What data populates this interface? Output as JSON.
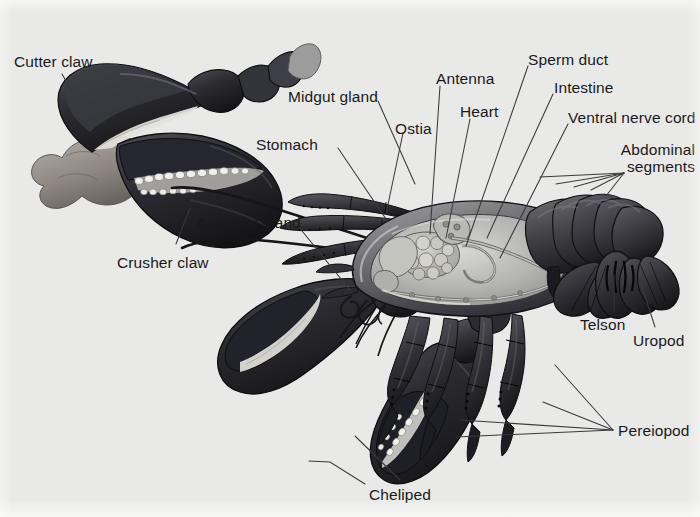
{
  "figure": {
    "background_color": "#e9e9e7",
    "label_color": "#19191b",
    "leader_color": "#3a3a3c",
    "width": 700,
    "height": 517
  },
  "labels": [
    {
      "id": "cutter-claw",
      "text": "Cutter claw",
      "x": 14,
      "y": 54,
      "align": "left"
    },
    {
      "id": "midgut-gland",
      "text": "Midgut gland",
      "x": 288,
      "y": 89,
      "align": "left"
    },
    {
      "id": "stomach",
      "text": "Stomach",
      "x": 256,
      "y": 137,
      "align": "left"
    },
    {
      "id": "ostia",
      "text": "Ostia",
      "x": 395,
      "y": 121,
      "align": "left"
    },
    {
      "id": "antenna",
      "text": "Antenna",
      "x": 436,
      "y": 71,
      "align": "left"
    },
    {
      "id": "heart",
      "text": "Heart",
      "x": 460,
      "y": 104,
      "align": "left"
    },
    {
      "id": "sperm-duct",
      "text": "Sperm duct",
      "x": 528,
      "y": 52,
      "align": "left"
    },
    {
      "id": "intestine",
      "text": "Intestine",
      "x": 554,
      "y": 80,
      "align": "left"
    },
    {
      "id": "ventral-nerve-cord",
      "text": "Ventral nerve cord",
      "x": 568,
      "y": 110,
      "align": "left"
    },
    {
      "id": "abdominal-segments",
      "text": "Abdominal\nsegments",
      "x": 695,
      "y": 142,
      "align": "right"
    },
    {
      "id": "antennal-gland",
      "text": "Antennal gland",
      "x": 196,
      "y": 215,
      "align": "left"
    },
    {
      "id": "crusher-claw",
      "text": "Crusher claw",
      "x": 117,
      "y": 255,
      "align": "left"
    },
    {
      "id": "telson",
      "text": "Telson",
      "x": 580,
      "y": 317,
      "align": "left"
    },
    {
      "id": "uropod",
      "text": "Uropod",
      "x": 633,
      "y": 333,
      "align": "left"
    },
    {
      "id": "pereiopod",
      "text": "Pereiopod",
      "x": 618,
      "y": 423,
      "align": "left"
    },
    {
      "id": "cheliped",
      "text": "Cheliped",
      "x": 369,
      "y": 487,
      "align": "left"
    }
  ],
  "leaders": [
    {
      "id": "leader-cutter-claw",
      "points": "62,74 86,116"
    },
    {
      "id": "leader-midgut-gland",
      "points": "378,101 415,184"
    },
    {
      "id": "leader-stomach",
      "points": "338,148 388,222"
    },
    {
      "id": "leader-ostia",
      "points": "403,133 386,214"
    },
    {
      "id": "leader-antenna",
      "points": "440,86 430,234"
    },
    {
      "id": "leader-heart",
      "points": "470,119 446,238"
    },
    {
      "id": "leader-sperm-duct",
      "points": "528,66 466,246"
    },
    {
      "id": "leader-intestine",
      "points": "553,94 487,238"
    },
    {
      "id": "leader-ventral-nerve-cord",
      "points": "568,124 500,258"
    },
    {
      "id": "leader-abdseg-1",
      "points": "624,173 540,177"
    },
    {
      "id": "leader-abdseg-2",
      "points": "624,173 556,184"
    },
    {
      "id": "leader-abdseg-3",
      "points": "624,173 574,187"
    },
    {
      "id": "leader-abdseg-4",
      "points": "624,173 591,190"
    },
    {
      "id": "leader-abdseg-5",
      "points": "624,173 606,196"
    },
    {
      "id": "leader-antennal-gland",
      "points": "298,226 350,290"
    },
    {
      "id": "leader-crusher-claw",
      "points": "176,244 190,208"
    },
    {
      "id": "leader-telson",
      "points": "614,312 614,275"
    },
    {
      "id": "leader-uropod",
      "points": "655,327 640,280"
    },
    {
      "id": "leader-pereiopod-1",
      "points": "613,430 555,365"
    },
    {
      "id": "leader-pereiopod-2",
      "points": "613,430 543,402"
    },
    {
      "id": "leader-pereiopod-3",
      "points": "613,430 460,420"
    },
    {
      "id": "leader-pereiopod-4",
      "points": "613,430 456,437"
    },
    {
      "id": "leader-cheliped-1",
      "points": "400,480 355,436"
    },
    {
      "id": "leader-cheliped-2",
      "points": "365,484 330,462 309,461"
    }
  ]
}
